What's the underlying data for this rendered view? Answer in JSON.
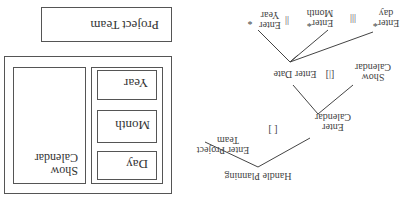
{
  "ui_mockup": {
    "project_team_label": "Project Team",
    "calendar_panel": {
      "show_calendar_label": "Show\nCalendar",
      "show_calendar_line1": "Show",
      "show_calendar_line2": "Calendar",
      "buttons": [
        {
          "label": "Day"
        },
        {
          "label": "Month"
        },
        {
          "label": "Year"
        }
      ]
    }
  },
  "task_tree": {
    "root": {
      "line1": "Handle Planning"
    },
    "children": [
      {
        "id": "enter-project-team",
        "line1": "Enter Project",
        "line2": "Team"
      },
      {
        "id": "enter-calendar",
        "line1": "Enter",
        "line2": "Calendar"
      }
    ],
    "operator_root": "[ ]",
    "calendar_children": [
      {
        "id": "enter-date",
        "line1": "Enter Date"
      },
      {
        "id": "show-calendar",
        "line1": "Show",
        "line2": "Calendar"
      }
    ],
    "operator_calendar": "[|]",
    "date_children": [
      {
        "id": "enter-day",
        "line1": "Enter*",
        "line2": "day"
      },
      {
        "id": "enter-month",
        "line1": "Enter*",
        "line2": "Month"
      },
      {
        "id": "enter-year",
        "line1": "Enter",
        "line2": "Year"
      }
    ],
    "operator_date_1": "|||",
    "operator_date_2": "||",
    "year_star": "*"
  },
  "orientation": "rotated 180 degrees"
}
